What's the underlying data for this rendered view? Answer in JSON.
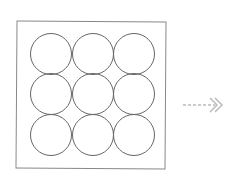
{
  "diagram": {
    "frame": {
      "x": 16,
      "y": 21,
      "width": 150,
      "height": 147,
      "stroke": "#888888"
    },
    "grid": {
      "rows": 3,
      "cols": 3,
      "radius": 20.5,
      "stroke": "#666666",
      "centers_x": [
        51,
        93,
        134
      ],
      "centers_y": [
        54,
        94,
        135
      ]
    },
    "arrow": {
      "icon": "dashed-double-chevron-right-icon",
      "color": "#bbbbbb"
    }
  }
}
